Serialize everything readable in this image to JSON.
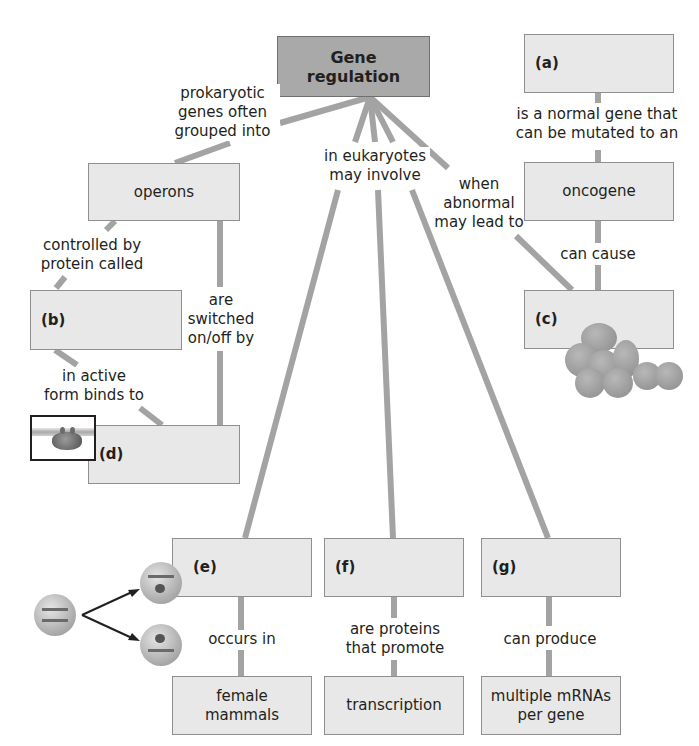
{
  "diagram": {
    "root": {
      "label": "Gene regulation"
    },
    "nodes": {
      "a": {
        "label": "(a)"
      },
      "oncogene": {
        "label": "oncogene"
      },
      "c": {
        "label": "(c)"
      },
      "operons": {
        "label": "operons"
      },
      "b": {
        "label": "(b)"
      },
      "d": {
        "label": "(d)"
      },
      "e": {
        "label": "(e)"
      },
      "f": {
        "label": "(f)"
      },
      "g": {
        "label": "(g)"
      },
      "female_mammals": {
        "label": "female mammals",
        "line1": "female",
        "line2": "mammals"
      },
      "transcription": {
        "label": "transcription"
      },
      "multiple_mrnas": {
        "label": "multiple mRNAs per gene",
        "line1": "multiple mRNAs",
        "line2": "per gene"
      }
    },
    "links": {
      "prokaryotic": {
        "line1": "prokaryotic",
        "line2": "genes often",
        "line3": "grouped into"
      },
      "eukaryotes": {
        "line1": "in eukaryotes",
        "line2": "may involve"
      },
      "abnormal": {
        "line1": "when",
        "line2": "abnormal",
        "line3": "may lead to"
      },
      "normal_gene": {
        "line1": "is a normal gene that",
        "line2": "can be mutated to an"
      },
      "can_cause": {
        "text": "can cause"
      },
      "controlled_by": {
        "line1": "controlled by",
        "line2": "protein called"
      },
      "switched": {
        "line1": "are",
        "line2": "switched",
        "line3": "on/off by"
      },
      "active_form": {
        "line1": "in active",
        "line2": "form binds to"
      },
      "occurs_in": {
        "text": "occurs in"
      },
      "proteins_promote": {
        "line1": "are proteins",
        "line2": "that promote"
      },
      "can_produce": {
        "text": "can produce"
      }
    },
    "illustrations": {
      "tumor_cells": "tumor-cells-icon",
      "repressor_dna": "repressor-bound-dna-icon",
      "x_inactivation": "x-inactivation-cells-icon"
    },
    "colors": {
      "root_fill": "#a9a9a9",
      "node_fill": "#e8e8e8",
      "node_border": "#8f8f8f",
      "connector": "#a3a3a3",
      "text": "#231f20"
    }
  }
}
